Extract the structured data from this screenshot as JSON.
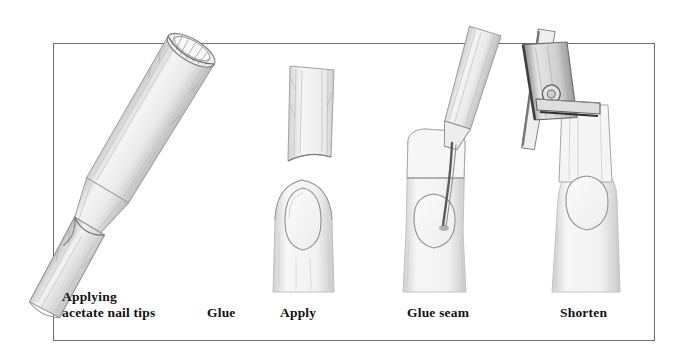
{
  "figure": {
    "title": "Applying acetate nail tips",
    "medium": "pencil-illustration",
    "background_color": "#ffffff",
    "frame": {
      "name": "illustration-frame",
      "border_color": "#6e6e6e",
      "border_width_px": 1,
      "x": 53,
      "y": 43,
      "width": 602,
      "height": 298
    },
    "captions": [
      {
        "id": "caption-applying",
        "text": "Applying\nacetate nail tips",
        "x": 62,
        "y": 289
      },
      {
        "id": "caption-glue",
        "text": "Glue",
        "x": 207,
        "y": 305
      },
      {
        "id": "caption-apply",
        "text": "Apply",
        "x": 280,
        "y": 305
      },
      {
        "id": "caption-glue-seam",
        "text": "Glue seam",
        "x": 407,
        "y": 305
      },
      {
        "id": "caption-shorten",
        "text": "Shorten",
        "x": 560,
        "y": 305
      }
    ],
    "panels": [
      {
        "id": "panel-glue-tube",
        "label": "Glue",
        "subject": "nail glue tube with brush applicator, drawn diagonally, overlapping the frame corner"
      },
      {
        "id": "panel-apply",
        "label": "Apply",
        "subject": "acetate nail tip held above a fingertip with natural nail"
      },
      {
        "id": "panel-glue-seam",
        "label": "Glue seam",
        "subject": "glue applicator tube touching the seam where tip meets the natural nail"
      },
      {
        "id": "panel-shorten",
        "label": "Shorten",
        "subject": "nail clippers trimming the applied acetate tip to length"
      }
    ],
    "ink": {
      "pencil_light": "#d9d9d9",
      "pencil_mid": "#b4b4b4",
      "pencil_dark": "#7a7a7a",
      "pencil_darkest": "#3c3c3c"
    }
  }
}
